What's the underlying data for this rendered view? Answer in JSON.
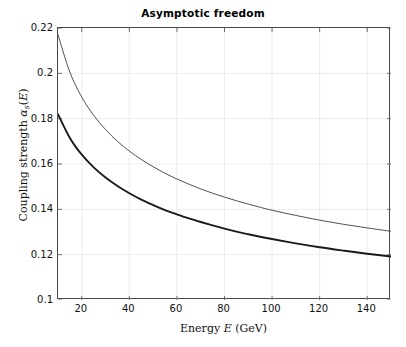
{
  "chart_data": {
    "type": "line",
    "title": "Asymptotic freedom",
    "xlabel": "Energy E (GeV)",
    "ylabel": "Coupling strength αₛ(E)",
    "xlim": [
      10,
      150
    ],
    "ylim": [
      0.1,
      0.22
    ],
    "xticks": [
      20,
      40,
      60,
      80,
      100,
      120,
      140
    ],
    "yticks": [
      0.1,
      0.12,
      0.14,
      0.16,
      0.18,
      0.2,
      0.22
    ],
    "grid": true,
    "legend": "none",
    "x": [
      10,
      15,
      20,
      25,
      30,
      35,
      40,
      45,
      50,
      55,
      60,
      65,
      70,
      75,
      80,
      85,
      90,
      95,
      100,
      110,
      120,
      130,
      140,
      150
    ],
    "series": [
      {
        "name": "upper-curve",
        "color": "#3c3c3c",
        "linewidth": 0.9,
        "values": [
          0.217,
          0.2005,
          0.1895,
          0.1815,
          0.1752,
          0.17,
          0.1657,
          0.162,
          0.1588,
          0.1559,
          0.1534,
          0.1511,
          0.149,
          0.1471,
          0.1454,
          0.1438,
          0.1423,
          0.1409,
          0.1396,
          0.1373,
          0.1352,
          0.1334,
          0.1318,
          0.1303
        ]
      },
      {
        "name": "lower-curve",
        "color": "#1a1a1a",
        "linewidth": 1.9,
        "values": [
          0.182,
          0.1715,
          0.1641,
          0.1585,
          0.154,
          0.1503,
          0.1471,
          0.1443,
          0.1419,
          0.1397,
          0.1378,
          0.136,
          0.1344,
          0.1329,
          0.1315,
          0.1302,
          0.129,
          0.1279,
          0.1269,
          0.125,
          0.1233,
          0.1218,
          0.1204,
          0.1192
        ]
      }
    ]
  },
  "axes": {
    "ytick_labels": [
      "0.22",
      "0.2",
      "0.18",
      "0.16",
      "0.14",
      "0.12",
      "0.1"
    ],
    "xtick_labels": [
      "20",
      "40",
      "60",
      "80",
      "100",
      "120",
      "140"
    ],
    "xlabel_parts": {
      "pre": "Energy ",
      "var": "E",
      "post": " (GeV)"
    },
    "ylabel_parts": {
      "pre": "Coupling strength ",
      "var": "α",
      "sub": "s",
      "open": "(",
      "var2": "E",
      "close": ")"
    }
  }
}
